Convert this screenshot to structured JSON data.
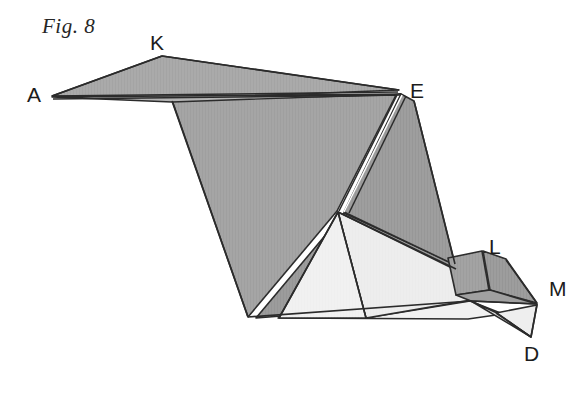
{
  "figure": {
    "caption": "Fig. 8",
    "type": "geometric-folding-diagram",
    "canvas": {
      "width": 588,
      "height": 407,
      "background": "#ffffff"
    },
    "colors": {
      "stroke": "#2b2b2b",
      "paper_white": "#ffffff",
      "fill_mid_gray": "#a9a9a9",
      "fill_dark_gray": "#9a9a9a",
      "fill_light_gray": "#eeeeee",
      "fill_pale_gray": "#e4e4e4",
      "label_color": "#1c1c1c"
    },
    "vertices": [
      {
        "name": "A",
        "label": "A",
        "x": 52,
        "y": 97,
        "label_x": 27,
        "label_y": 84
      },
      {
        "name": "K",
        "label": "K",
        "x": 162,
        "y": 57,
        "label_x": 150,
        "label_y": 32
      },
      {
        "name": "E",
        "label": "E",
        "x": 398,
        "y": 93,
        "label_x": 410,
        "label_y": 80
      },
      {
        "name": "L",
        "label": "L",
        "x": 500,
        "y": 258,
        "label_x": 489,
        "label_y": 236
      },
      {
        "name": "M",
        "label": "M",
        "x": 537,
        "y": 304,
        "label_x": 549,
        "label_y": 278
      },
      {
        "name": "D",
        "label": "D",
        "x": 531,
        "y": 337,
        "label_x": 524,
        "label_y": 343
      }
    ],
    "faces": [
      {
        "id": "face-AKE-top",
        "fill": "#a9a9a9",
        "points": "52,96 162,57 398,91 170,99"
      },
      {
        "id": "face-A-sliver",
        "fill": "#b2b2b2",
        "points": "52,98 398,94 200,104"
      },
      {
        "id": "face-main-body",
        "fill": "#a5a5a5",
        "points": "172,100 396,95 337,211 248,317"
      },
      {
        "id": "face-E-right-flap",
        "fill": "#9e9e9e",
        "points": "402,95 414,100 452,262 344,214"
      },
      {
        "id": "face-right-large",
        "fill": "#9a9a9a",
        "points": "344,214 452,262 470,300 255,318"
      },
      {
        "id": "face-light-triangle",
        "fill": "#f0f0f0",
        "points": "337,212 365,317 280,317"
      },
      {
        "id": "face-light-wedge",
        "fill": "#efefef",
        "points": "337,212 455,272 468,300 365,317"
      },
      {
        "id": "face-light-lower",
        "fill": "#f2f2f2",
        "points": "280,317 365,317 468,300 500,313"
      },
      {
        "id": "face-L-tab-left",
        "fill": "#a2a2a2",
        "points": "447,258 481,252 487,289 455,294"
      },
      {
        "id": "face-L-tab-right",
        "fill": "#9d9d9d",
        "points": "483,252 502,259 537,303 489,290"
      },
      {
        "id": "face-L-upper-edge",
        "fill": "#b0b0b0",
        "points": "481,251 503,258 534,300 506,268"
      },
      {
        "id": "face-M-lower",
        "fill": "#a0a0a0",
        "points": "455,294 489,290 537,304 470,301"
      },
      {
        "id": "face-D-triangle",
        "fill": "#ededed",
        "points": "497,312 537,305 531,337"
      },
      {
        "id": "face-D-sliver",
        "fill": "#e0e0e0",
        "points": "470,301 497,312 531,337 505,321"
      }
    ],
    "creases": [
      {
        "id": "crease-A-K",
        "from": "A",
        "to": "K"
      },
      {
        "id": "crease-K-E",
        "from": "K",
        "to": "E"
      },
      {
        "id": "crease-A-E-lower",
        "from": "A",
        "to": "E"
      },
      {
        "id": "crease-E-center",
        "from": "E",
        "to": "center-apex"
      },
      {
        "id": "crease-E-right",
        "from": "E",
        "to": "L-base"
      },
      {
        "id": "crease-body-left",
        "from": "K-base",
        "to": "bottom-left"
      },
      {
        "id": "crease-base",
        "from": "bottom-left",
        "to": "M"
      },
      {
        "id": "crease-apex-fan",
        "from": "center-apex",
        "to": "base"
      },
      {
        "id": "crease-L-fold",
        "from": "L",
        "to": "M"
      },
      {
        "id": "crease-M-D",
        "from": "M",
        "to": "D"
      }
    ]
  }
}
